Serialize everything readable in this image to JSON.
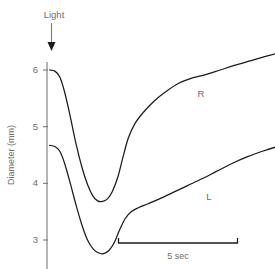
{
  "chart_data": {
    "type": "line",
    "title": "",
    "xlabel": "",
    "ylabel": "Diameter (mm)",
    "ylim": [
      2.6,
      6.4
    ],
    "yticks": [
      6,
      5,
      4,
      3
    ],
    "ytick_labels": [
      "6",
      "5",
      "4",
      "3"
    ],
    "grid": false,
    "legend": "inline-labels",
    "x_axis_shown": false,
    "annotations": [
      {
        "name": "light-stimulus",
        "label": "Light",
        "kind": "arrow",
        "x_sec": 0.0,
        "description": "Downward arrow marking onset of light stimulus at time zero"
      },
      {
        "name": "time-scale-bar",
        "label": "5 sec",
        "kind": "scale-bar",
        "length_sec": 5,
        "x_start_sec": 2.85,
        "x_end_sec": 7.85
      }
    ],
    "series": [
      {
        "name": "R",
        "label": "R",
        "description": "Right pupil diameter response to light",
        "baseline_mm": 6.0,
        "min_mm": 3.68,
        "final_mm": 6.34,
        "points": [
          {
            "t": 0.0,
            "mm": 6.0
          },
          {
            "t": 0.22,
            "mm": 5.98
          },
          {
            "t": 0.42,
            "mm": 5.88
          },
          {
            "t": 0.62,
            "mm": 5.62
          },
          {
            "t": 0.85,
            "mm": 5.2
          },
          {
            "t": 1.1,
            "mm": 4.7
          },
          {
            "t": 1.35,
            "mm": 4.28
          },
          {
            "t": 1.58,
            "mm": 3.98
          },
          {
            "t": 1.8,
            "mm": 3.78
          },
          {
            "t": 2.0,
            "mm": 3.69
          },
          {
            "t": 2.2,
            "mm": 3.68
          },
          {
            "t": 2.42,
            "mm": 3.73
          },
          {
            "t": 2.62,
            "mm": 3.86
          },
          {
            "t": 2.85,
            "mm": 4.12
          },
          {
            "t": 3.05,
            "mm": 4.45
          },
          {
            "t": 3.28,
            "mm": 4.8
          },
          {
            "t": 3.55,
            "mm": 5.05
          },
          {
            "t": 3.9,
            "mm": 5.25
          },
          {
            "t": 4.35,
            "mm": 5.45
          },
          {
            "t": 4.85,
            "mm": 5.62
          },
          {
            "t": 5.4,
            "mm": 5.77
          },
          {
            "t": 5.95,
            "mm": 5.86
          },
          {
            "t": 6.5,
            "mm": 5.92
          },
          {
            "t": 7.1,
            "mm": 6.0
          },
          {
            "t": 7.7,
            "mm": 6.08
          },
          {
            "t": 8.35,
            "mm": 6.16
          },
          {
            "t": 9.0,
            "mm": 6.24
          },
          {
            "t": 9.55,
            "mm": 6.3
          },
          {
            "t": 10.0,
            "mm": 6.34
          }
        ]
      },
      {
        "name": "L",
        "label": "L",
        "description": "Left pupil diameter consensual response to light",
        "baseline_mm": 4.67,
        "min_mm": 2.76,
        "final_mm": 4.7,
        "points": [
          {
            "t": 0.0,
            "mm": 4.67
          },
          {
            "t": 0.22,
            "mm": 4.65
          },
          {
            "t": 0.42,
            "mm": 4.57
          },
          {
            "t": 0.62,
            "mm": 4.36
          },
          {
            "t": 0.85,
            "mm": 4.02
          },
          {
            "t": 1.1,
            "mm": 3.62
          },
          {
            "t": 1.35,
            "mm": 3.26
          },
          {
            "t": 1.58,
            "mm": 3.0
          },
          {
            "t": 1.82,
            "mm": 2.84
          },
          {
            "t": 2.05,
            "mm": 2.77
          },
          {
            "t": 2.25,
            "mm": 2.76
          },
          {
            "t": 2.48,
            "mm": 2.82
          },
          {
            "t": 2.7,
            "mm": 2.96
          },
          {
            "t": 2.92,
            "mm": 3.18
          },
          {
            "t": 3.15,
            "mm": 3.38
          },
          {
            "t": 3.4,
            "mm": 3.5
          },
          {
            "t": 3.7,
            "mm": 3.57
          },
          {
            "t": 4.1,
            "mm": 3.64
          },
          {
            "t": 4.6,
            "mm": 3.73
          },
          {
            "t": 5.15,
            "mm": 3.84
          },
          {
            "t": 5.75,
            "mm": 3.96
          },
          {
            "t": 6.35,
            "mm": 4.08
          },
          {
            "t": 6.95,
            "mm": 4.21
          },
          {
            "t": 7.6,
            "mm": 4.35
          },
          {
            "t": 8.25,
            "mm": 4.47
          },
          {
            "t": 8.9,
            "mm": 4.57
          },
          {
            "t": 9.5,
            "mm": 4.65
          },
          {
            "t": 10.0,
            "mm": 4.7
          }
        ]
      }
    ]
  }
}
